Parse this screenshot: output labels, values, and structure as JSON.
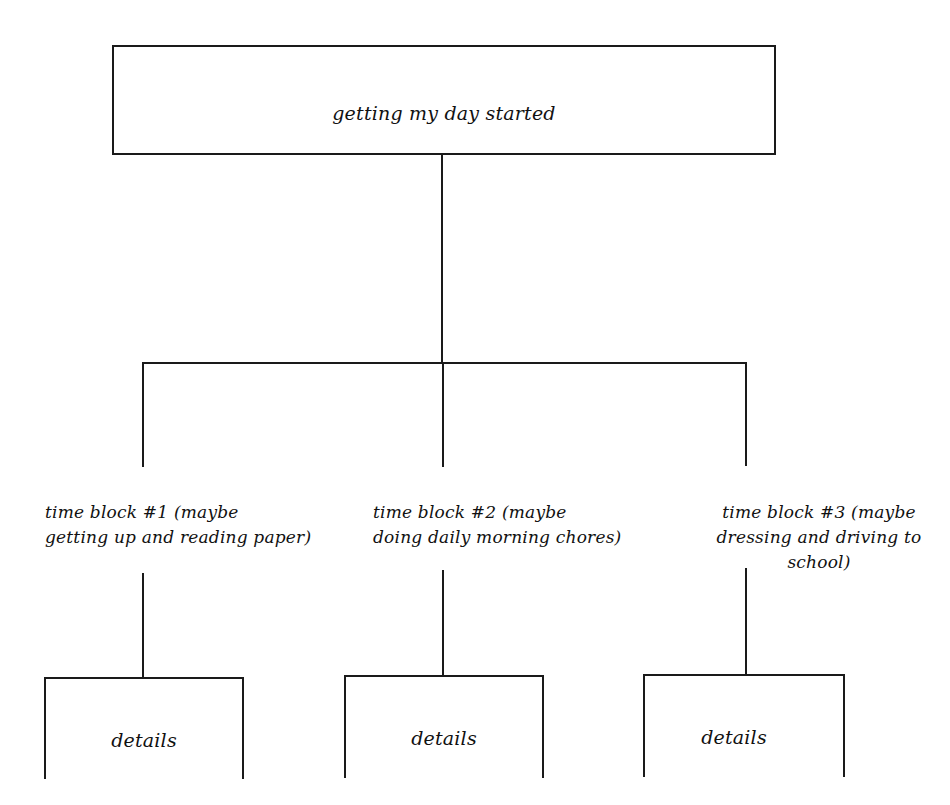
{
  "diagram": {
    "type": "hierarchy-chart",
    "root": {
      "label": "getting my day started"
    },
    "time_blocks": [
      {
        "label": "time block #1 (maybe\ngetting up and reading paper)",
        "detail": "details"
      },
      {
        "label": "time block #2 (maybe\ndoing daily morning chores)",
        "detail": "details"
      },
      {
        "label": "time block #3 (maybe\ndressing and driving to\nschool)",
        "detail": "details"
      }
    ],
    "colors": {
      "line": "#1a1a1a",
      "background": "#ffffff",
      "text": "#111111"
    }
  }
}
